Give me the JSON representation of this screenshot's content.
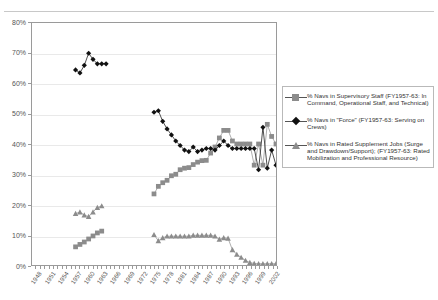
{
  "chart_data": {
    "type": "line",
    "title": "",
    "xlabel": "",
    "ylabel": "",
    "ylim": [
      0,
      80
    ],
    "ytick_labels": [
      "0%",
      "10%",
      "20%",
      "30%",
      "40%",
      "50%",
      "60%",
      "70%",
      "80%"
    ],
    "ytick_values": [
      0,
      10,
      20,
      30,
      40,
      50,
      60,
      70,
      80
    ],
    "grid": true,
    "legend_position": "right",
    "x": [
      1948,
      1949,
      1950,
      1951,
      1952,
      1953,
      1954,
      1955,
      1956,
      1957,
      1958,
      1959,
      1960,
      1961,
      1962,
      1963,
      1964,
      1965,
      1966,
      1967,
      1968,
      1969,
      1970,
      1971,
      1972,
      1973,
      1974,
      1975,
      1976,
      1977,
      1978,
      1979,
      1980,
      1981,
      1982,
      1983,
      1984,
      1985,
      1986,
      1987,
      1988,
      1989,
      1990,
      1991,
      1992,
      1993,
      1994,
      1995,
      1996,
      1997,
      1998,
      1999,
      2000,
      2001,
      2002,
      2003
    ],
    "xtick_labels": [
      "1948",
      "1951",
      "1954",
      "1957",
      "1960",
      "1963",
      "1966",
      "1969",
      "1972",
      "1975",
      "1978",
      "1981",
      "1984",
      "1987",
      "1990",
      "1993",
      "1996",
      "1999",
      "2002"
    ],
    "xtick_values": [
      1948,
      1951,
      1954,
      1957,
      1960,
      1963,
      1966,
      1969,
      1972,
      1975,
      1978,
      1981,
      1984,
      1987,
      1990,
      1993,
      1996,
      1999,
      2002
    ],
    "xlim": [
      1947,
      2003
    ],
    "series": [
      {
        "name": "% Navs in Supervisory Staff (FY1957-63: In Command, Operational Staff, and Technical)",
        "marker": "square",
        "color": "#8c8c8c",
        "points": [
          [
            1957,
            6.0
          ],
          [
            1958,
            6.8
          ],
          [
            1959,
            7.6
          ],
          [
            1960,
            8.6
          ],
          [
            1961,
            9.6
          ],
          [
            1962,
            10.6
          ],
          [
            1963,
            11.2
          ],
          [
            1975,
            23.5
          ],
          [
            1976,
            26.0
          ],
          [
            1977,
            27.2
          ],
          [
            1978,
            28.0
          ],
          [
            1979,
            29.5
          ],
          [
            1980,
            30.0
          ],
          [
            1981,
            31.5
          ],
          [
            1982,
            32.0
          ],
          [
            1983,
            32.2
          ],
          [
            1984,
            33.2
          ],
          [
            1985,
            34.0
          ],
          [
            1986,
            34.5
          ],
          [
            1987,
            34.6
          ],
          [
            1988,
            37.0
          ],
          [
            1989,
            39.0
          ],
          [
            1990,
            42.0
          ],
          [
            1991,
            44.5
          ],
          [
            1992,
            44.5
          ],
          [
            1993,
            41.0
          ],
          [
            1994,
            40.0
          ],
          [
            1995,
            40.0
          ],
          [
            1996,
            40.0
          ],
          [
            1997,
            40.0
          ],
          [
            1998,
            33.0
          ],
          [
            1999,
            40.0
          ],
          [
            2000,
            33.0
          ],
          [
            2001,
            46.5
          ],
          [
            2002,
            42.5
          ],
          [
            2003,
            40.0
          ]
        ]
      },
      {
        "name": "% Navs in \"Force\" (FY1957-63:  Serving on Crews)",
        "marker": "diamond",
        "color": "#111111",
        "points": [
          [
            1957,
            64.5
          ],
          [
            1958,
            63.5
          ],
          [
            1959,
            66.0
          ],
          [
            1960,
            70.0
          ],
          [
            1961,
            68.0
          ],
          [
            1962,
            66.5
          ],
          [
            1963,
            66.5
          ],
          [
            1964,
            66.5
          ],
          [
            1975,
            50.5
          ],
          [
            1976,
            51.0
          ],
          [
            1977,
            47.5
          ],
          [
            1978,
            45.0
          ],
          [
            1979,
            43.0
          ],
          [
            1980,
            41.0
          ],
          [
            1981,
            39.5
          ],
          [
            1982,
            38.0
          ],
          [
            1983,
            37.5
          ],
          [
            1984,
            39.0
          ],
          [
            1985,
            37.5
          ],
          [
            1986,
            38.0
          ],
          [
            1987,
            38.5
          ],
          [
            1988,
            38.5
          ],
          [
            1989,
            38.0
          ],
          [
            1990,
            39.5
          ],
          [
            1991,
            41.0
          ],
          [
            1992,
            39.5
          ],
          [
            1993,
            38.5
          ],
          [
            1994,
            38.5
          ],
          [
            1995,
            38.5
          ],
          [
            1996,
            38.5
          ],
          [
            1997,
            38.5
          ],
          [
            1998,
            38.5
          ],
          [
            1999,
            31.5
          ],
          [
            2000,
            45.5
          ],
          [
            2001,
            32.0
          ],
          [
            2002,
            38.0
          ],
          [
            2003,
            33.0
          ]
        ]
      },
      {
        "name": "% Navs in Rated Supplement Jobs (Surge and Drawdown/Support); (FY1957-63: Rated Mobilization and Professional Resource)",
        "marker": "triangle",
        "color": "#8c8c8c",
        "points": [
          [
            1957,
            17.0
          ],
          [
            1958,
            17.5
          ],
          [
            1959,
            16.5
          ],
          [
            1960,
            16.0
          ],
          [
            1961,
            17.5
          ],
          [
            1962,
            19.0
          ],
          [
            1963,
            19.5
          ],
          [
            1975,
            10.0
          ],
          [
            1976,
            8.0
          ],
          [
            1977,
            9.0
          ],
          [
            1978,
            9.5
          ],
          [
            1979,
            9.5
          ],
          [
            1980,
            9.5
          ],
          [
            1981,
            9.5
          ],
          [
            1982,
            9.5
          ],
          [
            1983,
            9.5
          ],
          [
            1984,
            9.8
          ],
          [
            1985,
            9.8
          ],
          [
            1986,
            9.8
          ],
          [
            1987,
            9.8
          ],
          [
            1988,
            9.8
          ],
          [
            1989,
            9.5
          ],
          [
            1990,
            8.5
          ],
          [
            1991,
            9.0
          ],
          [
            1992,
            8.8
          ],
          [
            1993,
            5.0
          ],
          [
            1994,
            3.5
          ],
          [
            1995,
            2.5
          ],
          [
            1996,
            1.5
          ],
          [
            1997,
            0.8
          ],
          [
            1998,
            0.5
          ],
          [
            1999,
            0.4
          ],
          [
            2000,
            0.4
          ],
          [
            2001,
            0.4
          ],
          [
            2002,
            0.4
          ],
          [
            2003,
            0.4
          ]
        ]
      }
    ]
  },
  "legend": {
    "items": [
      {
        "label": "% Navs in Supervisory Staff (FY1957-63: In Command, Operational Staff, and Technical)",
        "marker": "square-marker"
      },
      {
        "label": "% Navs in \"Force\" (FY1957-63:  Serving on Crews)",
        "marker": "diamond-marker"
      },
      {
        "label": "% Navs in Rated Supplement Jobs (Surge and Drawdown/Support); (FY1957-63: Rated Mobilization and Professional Resource)",
        "marker": "triangle-marker"
      }
    ]
  }
}
